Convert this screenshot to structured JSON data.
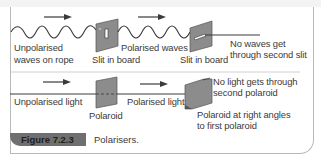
{
  "figure": {
    "number_label": "Figure 7.2.3",
    "caption": "Polarisers.",
    "colors": {
      "caption_bar": "#6f6f6f",
      "board_fill": "#8c8c8c",
      "line": "#3a3a3a",
      "text": "#3a3a3a"
    }
  },
  "top_row": {
    "title": "Rope and slit analogy",
    "labels": {
      "unpolarised_line1": "Unpolarised",
      "unpolarised_line2": "waves on rope",
      "slit1": "Slit in board",
      "polarised_waves": "Polarised waves",
      "slit2": "Slit in board",
      "result_line1": "No waves get",
      "result_line2": "through second slit"
    }
  },
  "bottom_row": {
    "title": "Light and polaroid",
    "labels": {
      "unpolarised_light": "Unpolarised light",
      "polaroid1": "Polaroid",
      "polarised_light": "Polarised light",
      "result_line1": "No light gets through",
      "result_line2": "second polaroid",
      "polaroid2_line1": "Polaroid at right angles",
      "polaroid2_line2": "to first polaroid"
    }
  }
}
